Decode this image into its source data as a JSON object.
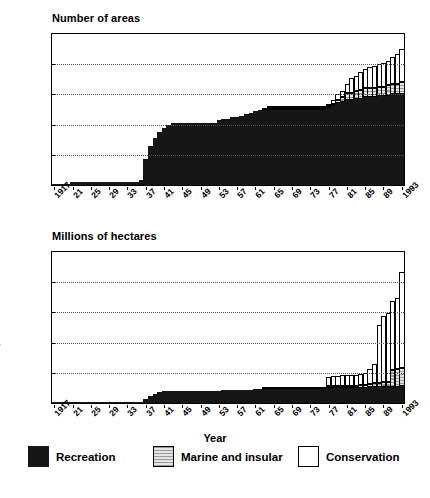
{
  "figure": {
    "axis_caption": "Year",
    "colors": {
      "recreation": "#161616",
      "marine_and_insular": "#d2d2d2",
      "conservation": "#ffffff"
    }
  },
  "legend": {
    "items": [
      {
        "label": "Recreation",
        "key": "recreation"
      },
      {
        "label": "Marine and insular",
        "key": "marine_and_insular"
      },
      {
        "label": "Conservation",
        "key": "conservation"
      }
    ]
  },
  "chart_data": [
    {
      "id": "number-of-areas",
      "type": "bar",
      "stacked": true,
      "title": "Number of areas",
      "xlabel": "Year",
      "ylabel": "Number of areas",
      "ylim": [
        0,
        100
      ],
      "yticks": [
        0,
        20,
        40,
        60,
        80,
        100
      ],
      "grid": true,
      "legend_position": "below-figure",
      "x": [
        1917,
        1918,
        1919,
        1920,
        1921,
        1922,
        1923,
        1924,
        1925,
        1926,
        1927,
        1928,
        1929,
        1930,
        1931,
        1932,
        1933,
        1934,
        1935,
        1936,
        1937,
        1938,
        1939,
        1940,
        1941,
        1942,
        1943,
        1944,
        1945,
        1946,
        1947,
        1948,
        1949,
        1950,
        1951,
        1952,
        1953,
        1954,
        1955,
        1956,
        1957,
        1958,
        1959,
        1960,
        1961,
        1962,
        1963,
        1964,
        1965,
        1966,
        1967,
        1968,
        1969,
        1970,
        1971,
        1972,
        1973,
        1974,
        1975,
        1976,
        1977,
        1978,
        1979,
        1980,
        1981,
        1982,
        1983,
        1984,
        1985,
        1986,
        1987,
        1988,
        1989,
        1990,
        1991,
        1992,
        1993
      ],
      "xtick_labels": [
        "1917",
        "21",
        "25",
        "29",
        "33",
        "37",
        "41",
        "45",
        "49",
        "53",
        "57",
        "61",
        "65",
        "69",
        "73",
        "77",
        "81",
        "85",
        "89",
        "1993"
      ],
      "xtick_values": [
        1917,
        1921,
        1925,
        1929,
        1933,
        1937,
        1941,
        1945,
        1949,
        1953,
        1957,
        1961,
        1965,
        1969,
        1973,
        1977,
        1981,
        1985,
        1989,
        1993
      ],
      "series": [
        {
          "name": "Recreation",
          "values": [
            1,
            1,
            1,
            1,
            2,
            2,
            2,
            2,
            2,
            2,
            2,
            2,
            2,
            2,
            2,
            2,
            2,
            2,
            2,
            3,
            17,
            26,
            31,
            35,
            38,
            40,
            41,
            41,
            41,
            41,
            41,
            41,
            41,
            41,
            41,
            41,
            43,
            44,
            44,
            45,
            45,
            46,
            47,
            48,
            49,
            50,
            50,
            50,
            50,
            50,
            50,
            50,
            50,
            50,
            50,
            50,
            50,
            50,
            50,
            50,
            51,
            52,
            54,
            55,
            56,
            56,
            57,
            57,
            58,
            58,
            58,
            59,
            59,
            59,
            60,
            60,
            60
          ]
        },
        {
          "name": "Marine and insular",
          "values": [
            0,
            0,
            0,
            0,
            0,
            0,
            0,
            0,
            0,
            0,
            0,
            0,
            0,
            0,
            0,
            0,
            0,
            0,
            0,
            0,
            0,
            0,
            0,
            0,
            0,
            0,
            0,
            0,
            0,
            0,
            0,
            0,
            0,
            0,
            0,
            0,
            0,
            0,
            0,
            0,
            0,
            0,
            0,
            0,
            0,
            0,
            1,
            1,
            1,
            1,
            1,
            1,
            1,
            1,
            1,
            1,
            1,
            1,
            1,
            1,
            1,
            1,
            2,
            3,
            5,
            5,
            5,
            6,
            6,
            6,
            6,
            6,
            6,
            7,
            7,
            7,
            8
          ]
        },
        {
          "name": "Conservation",
          "values": [
            0,
            0,
            0,
            0,
            0,
            0,
            0,
            0,
            0,
            0,
            0,
            0,
            0,
            0,
            0,
            0,
            0,
            0,
            0,
            0,
            0,
            0,
            0,
            0,
            0,
            0,
            0,
            0,
            0,
            0,
            0,
            0,
            0,
            0,
            0,
            0,
            0,
            0,
            0,
            0,
            0,
            0,
            0,
            0,
            0,
            0,
            0,
            1,
            1,
            1,
            1,
            1,
            1,
            1,
            1,
            1,
            1,
            1,
            1,
            1,
            1,
            3,
            4,
            4,
            6,
            10,
            10,
            12,
            13,
            14,
            15,
            15,
            16,
            16,
            18,
            20,
            22
          ]
        }
      ],
      "totals": [
        1,
        1,
        1,
        1,
        2,
        2,
        2,
        2,
        2,
        2,
        2,
        2,
        2,
        2,
        2,
        2,
        2,
        2,
        2,
        3,
        17,
        26,
        31,
        35,
        38,
        40,
        41,
        41,
        41,
        41,
        41,
        41,
        41,
        41,
        41,
        41,
        43,
        44,
        44,
        45,
        45,
        46,
        47,
        48,
        49,
        50,
        51,
        52,
        52,
        52,
        52,
        52,
        52,
        52,
        52,
        52,
        52,
        52,
        52,
        52,
        53,
        56,
        60,
        62,
        67,
        71,
        72,
        75,
        77,
        78,
        79,
        80,
        81,
        82,
        85,
        87,
        90
      ]
    },
    {
      "id": "millions-of-hectares",
      "type": "bar",
      "stacked": true,
      "title": "Millions of hectares",
      "xlabel": "Year",
      "ylabel": "Millions of hectares",
      "ylim": [
        0,
        10
      ],
      "yticks": [
        0,
        2,
        4,
        6,
        8,
        10
      ],
      "grid": true,
      "legend_position": "below-figure",
      "x": [
        1917,
        1918,
        1919,
        1920,
        1921,
        1922,
        1923,
        1924,
        1925,
        1926,
        1927,
        1928,
        1929,
        1930,
        1931,
        1932,
        1933,
        1934,
        1935,
        1936,
        1937,
        1938,
        1939,
        1940,
        1941,
        1942,
        1943,
        1944,
        1945,
        1946,
        1947,
        1948,
        1949,
        1950,
        1951,
        1952,
        1953,
        1954,
        1955,
        1956,
        1957,
        1958,
        1959,
        1960,
        1961,
        1962,
        1963,
        1964,
        1965,
        1966,
        1967,
        1968,
        1969,
        1970,
        1971,
        1972,
        1973,
        1974,
        1975,
        1976,
        1977,
        1978,
        1979,
        1980,
        1981,
        1982,
        1983,
        1984,
        1985,
        1986,
        1987,
        1988,
        1989,
        1990,
        1991,
        1992,
        1993
      ],
      "xtick_labels": [
        "1917",
        "21",
        "25",
        "29",
        "33",
        "37",
        "41",
        "45",
        "49",
        "53",
        "57",
        "61",
        "65",
        "69",
        "73",
        "77",
        "81",
        "85",
        "89",
        "1993"
      ],
      "xtick_values": [
        1917,
        1921,
        1925,
        1929,
        1933,
        1937,
        1941,
        1945,
        1949,
        1953,
        1957,
        1961,
        1965,
        1969,
        1973,
        1977,
        1981,
        1985,
        1989,
        1993
      ],
      "series": [
        {
          "name": "Recreation",
          "values": [
            0.02,
            0.02,
            0.02,
            0.02,
            0.03,
            0.03,
            0.03,
            0.03,
            0.03,
            0.03,
            0.03,
            0.03,
            0.03,
            0.03,
            0.03,
            0.03,
            0.04,
            0.04,
            0.04,
            0.05,
            0.25,
            0.45,
            0.6,
            0.7,
            0.78,
            0.8,
            0.8,
            0.8,
            0.8,
            0.8,
            0.8,
            0.8,
            0.8,
            0.8,
            0.8,
            0.8,
            0.82,
            0.83,
            0.83,
            0.84,
            0.85,
            0.86,
            0.87,
            0.88,
            0.9,
            0.92,
            0.95,
            0.95,
            0.95,
            0.95,
            0.95,
            0.95,
            0.95,
            0.95,
            0.95,
            0.95,
            0.95,
            0.95,
            0.95,
            0.95,
            0.97,
            0.98,
            0.99,
            1.0,
            1.0,
            1.0,
            1.0,
            1.02,
            1.02,
            1.03,
            1.04,
            1.05,
            1.05,
            1.06,
            1.07,
            1.08,
            1.1
          ]
        },
        {
          "name": "Marine and insular",
          "values": [
            0,
            0,
            0,
            0,
            0,
            0,
            0,
            0,
            0,
            0,
            0,
            0,
            0,
            0,
            0,
            0,
            0,
            0,
            0,
            0,
            0,
            0,
            0,
            0,
            0,
            0,
            0,
            0,
            0,
            0,
            0,
            0,
            0,
            0,
            0,
            0,
            0,
            0,
            0,
            0,
            0,
            0,
            0,
            0,
            0,
            0,
            0.1,
            0.1,
            0.12,
            0.12,
            0.12,
            0.12,
            0.12,
            0.12,
            0.12,
            0.12,
            0.12,
            0.12,
            0.12,
            0.12,
            0.13,
            0.14,
            0.14,
            0.14,
            0.15,
            0.15,
            0.16,
            0.18,
            0.2,
            0.25,
            0.3,
            0.3,
            0.32,
            0.35,
            1.1,
            1.15,
            1.2
          ]
        },
        {
          "name": "Conservation",
          "values": [
            0,
            0,
            0,
            0,
            0,
            0,
            0,
            0,
            0,
            0,
            0,
            0,
            0,
            0,
            0,
            0,
            0,
            0,
            0,
            0,
            0,
            0,
            0,
            0,
            0,
            0,
            0,
            0,
            0,
            0,
            0,
            0,
            0,
            0,
            0,
            0,
            0,
            0,
            0,
            0,
            0,
            0,
            0,
            0,
            0,
            0,
            0,
            0,
            0,
            0,
            0,
            0,
            0,
            0,
            0,
            0,
            0,
            0,
            0,
            0,
            0.6,
            0.65,
            0.68,
            0.7,
            0.7,
            0.7,
            0.72,
            0.75,
            0.78,
            1.0,
            1.25,
            3.8,
            4.4,
            4.55,
            4.6,
            4.75,
            6.4
          ]
        }
      ],
      "totals": [
        0.02,
        0.02,
        0.02,
        0.02,
        0.03,
        0.03,
        0.03,
        0.03,
        0.03,
        0.03,
        0.03,
        0.03,
        0.03,
        0.03,
        0.03,
        0.03,
        0.04,
        0.04,
        0.04,
        0.05,
        0.25,
        0.45,
        0.6,
        0.7,
        0.78,
        0.8,
        0.8,
        0.8,
        0.8,
        0.8,
        0.8,
        0.8,
        0.8,
        0.8,
        0.8,
        0.8,
        0.82,
        0.83,
        0.83,
        0.84,
        0.85,
        0.86,
        0.87,
        0.88,
        0.9,
        0.92,
        1.05,
        1.05,
        1.07,
        1.07,
        1.07,
        1.07,
        1.07,
        1.07,
        1.07,
        1.07,
        1.07,
        1.07,
        1.07,
        1.07,
        1.7,
        1.77,
        1.81,
        1.84,
        1.85,
        1.85,
        1.88,
        1.95,
        2.0,
        2.28,
        2.59,
        5.15,
        5.77,
        5.93,
        6.92,
        7.0,
        8.7
      ]
    }
  ]
}
